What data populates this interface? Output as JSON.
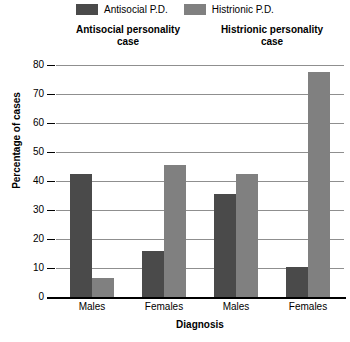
{
  "legend": {
    "entries": [
      {
        "label": "Antisocial P.D.",
        "color": "#4a4a4a",
        "icon": "legend-swatch-icon"
      },
      {
        "label": "Histrionic P.D.",
        "color": "#808080",
        "icon": "legend-swatch-icon"
      }
    ]
  },
  "panels": [
    {
      "line1": "Antisocial personality",
      "line2": "case"
    },
    {
      "line1": "Histrionic personality",
      "line2": "case"
    }
  ],
  "axis": {
    "y_title": "Percentage of cases",
    "x_title": "Diagnosis",
    "y_ticks": [
      "0",
      "10",
      "20",
      "30",
      "40",
      "50",
      "60",
      "70",
      "80"
    ]
  },
  "chart_data": {
    "type": "bar",
    "title": "",
    "xlabel": "Diagnosis",
    "ylabel": "Percentage of cases",
    "ylim": [
      0,
      80
    ],
    "ytick_step": 10,
    "grid": true,
    "legend_position": "top-center",
    "categories": [
      "Males",
      "Females",
      "Males",
      "Females"
    ],
    "group_titles": [
      "Antisocial personality case",
      "Histrionic personality case"
    ],
    "series": [
      {
        "name": "Antisocial P.D.",
        "color": "#4a4a4a",
        "values": [
          42.5,
          16,
          35.5,
          10.5
        ]
      },
      {
        "name": "Histrionic P.D.",
        "color": "#808080",
        "values": [
          6.5,
          45.5,
          42.5,
          77.5
        ]
      }
    ]
  }
}
